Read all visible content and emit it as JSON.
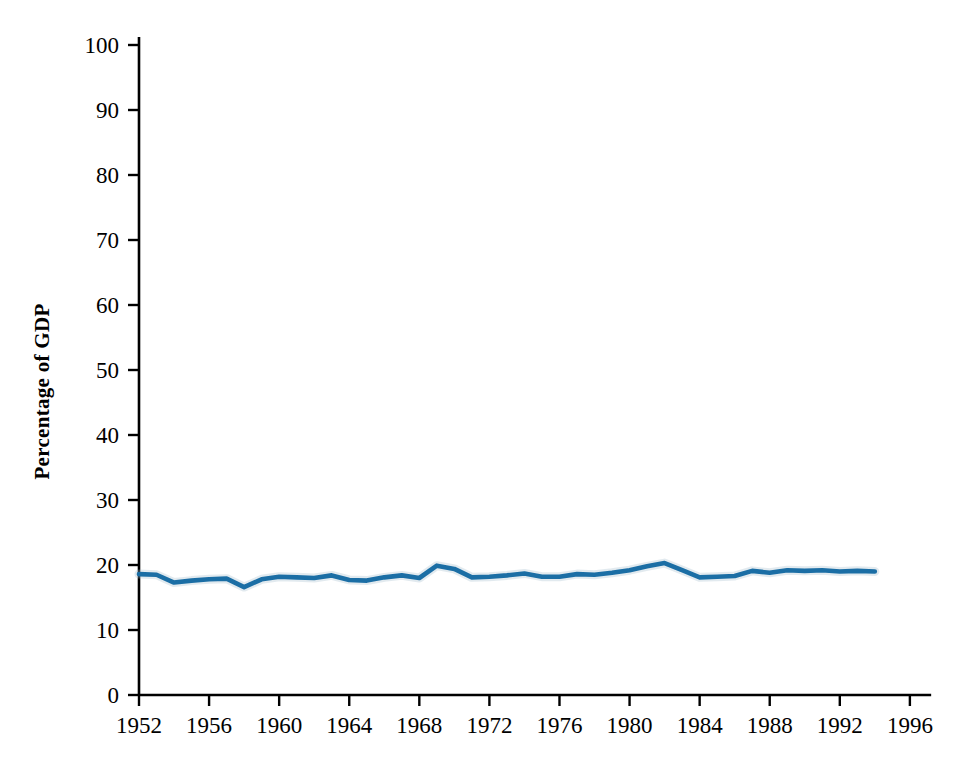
{
  "chart_data": {
    "type": "line",
    "title": "",
    "xlabel": "",
    "ylabel": "Percentage of GDP",
    "xlim": [
      1952,
      1997.5
    ],
    "ylim": [
      0,
      100
    ],
    "grid": false,
    "legend": "none",
    "x_ticks": [
      1952,
      1956,
      1960,
      1964,
      1968,
      1972,
      1976,
      1980,
      1984,
      1988,
      1992,
      1996
    ],
    "y_ticks": [
      0,
      10,
      20,
      30,
      40,
      50,
      60,
      70,
      80,
      90,
      100
    ],
    "series": [
      {
        "name": "Percentage of GDP",
        "color": "#1b6ea5",
        "x": [
          1952,
          1953,
          1954,
          1955,
          1956,
          1957,
          1958,
          1959,
          1960,
          1961,
          1962,
          1963,
          1964,
          1965,
          1966,
          1967,
          1968,
          1969,
          1970,
          1971,
          1972,
          1973,
          1974,
          1975,
          1976,
          1977,
          1978,
          1979,
          1980,
          1981,
          1982,
          1983,
          1984,
          1985,
          1986,
          1987,
          1988,
          1989,
          1990,
          1991,
          1992,
          1993,
          1994
        ],
        "values": [
          18.6,
          18.5,
          17.3,
          17.6,
          17.8,
          17.9,
          16.6,
          17.8,
          18.2,
          18.1,
          18.0,
          18.4,
          17.7,
          17.6,
          18.1,
          18.4,
          18.0,
          19.9,
          19.4,
          18.1,
          18.2,
          18.4,
          18.7,
          18.2,
          18.2,
          18.6,
          18.5,
          18.8,
          19.2,
          19.8,
          20.3,
          19.2,
          18.1,
          18.2,
          18.3,
          19.1,
          18.8,
          19.2,
          19.1,
          19.2,
          19.0,
          19.1,
          19.0
        ],
        "units": "percent"
      }
    ]
  },
  "axis": {
    "y_label_text": "Percentage of GDP"
  }
}
